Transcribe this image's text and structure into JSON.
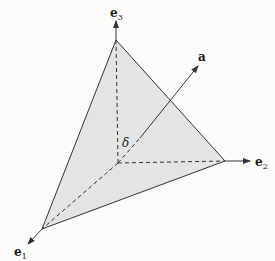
{
  "diagram": {
    "type": "3d-simplex-with-normal-vector",
    "colors": {
      "background": "#fbfbfa",
      "face_fill": "#e4e4e4",
      "stroke": "#333333"
    },
    "points": {
      "origin": [
        118,
        163
      ],
      "v1": [
        42,
        229
      ],
      "v2": [
        225,
        161
      ],
      "v3": [
        116,
        40
      ],
      "e1_tip": [
        28,
        244
      ],
      "e2_tip": [
        250,
        161
      ],
      "e3_tip": [
        116,
        21
      ],
      "a_dash_end": [
        140,
        138
      ],
      "a_tip": [
        198,
        66
      ]
    },
    "labels": {
      "e1": {
        "base": "e",
        "sub": "1",
        "pos": [
          14,
          256
        ]
      },
      "e2": {
        "base": "e",
        "sub": "2",
        "pos": [
          255,
          166
        ]
      },
      "e3": {
        "base": "e",
        "sub": "3",
        "pos": [
          110,
          17
        ]
      },
      "a": {
        "text": "a",
        "pos": [
          198,
          61
        ]
      },
      "delta": {
        "text": "δ",
        "pos": [
          122,
          147
        ]
      }
    }
  }
}
